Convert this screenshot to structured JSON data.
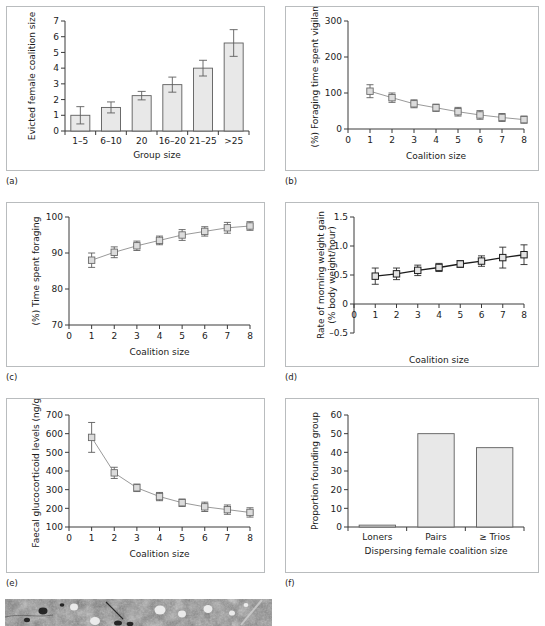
{
  "figure": {
    "panel_labels": [
      "(a)",
      "(b)",
      "(c)",
      "(d)",
      "(e)",
      "(f)",
      "(e)"
    ]
  },
  "chart_data": [
    {
      "id": "a",
      "panel_label": "(a)",
      "type": "bar",
      "title": "",
      "xlabel": "Group size",
      "ylabel": "Evicted female coalition size",
      "categories": [
        "1–5",
        "6–10",
        "20",
        "16–20",
        "21–25",
        ">25"
      ],
      "values": [
        1.0,
        1.5,
        2.25,
        2.95,
        4.0,
        5.6
      ],
      "errors": [
        0.55,
        0.35,
        0.27,
        0.48,
        0.5,
        0.85
      ],
      "ylim": [
        0,
        7
      ],
      "yticks": [
        0,
        1,
        2,
        3,
        4,
        5,
        6,
        7
      ],
      "grid": false,
      "legend": "none"
    },
    {
      "id": "b",
      "panel_label": "(b)",
      "type": "line",
      "title": "",
      "xlabel": "Coalition size",
      "ylabel": "(%) Foraging time spent vigilant",
      "x": [
        1,
        2,
        3,
        4,
        5,
        6,
        7,
        8
      ],
      "values": [
        105,
        87,
        70,
        59,
        48,
        39,
        32,
        26
      ],
      "errors": [
        18,
        13,
        11,
        10,
        12,
        12,
        11,
        10
      ],
      "xlim": [
        0,
        8
      ],
      "xticks": [
        0,
        1,
        2,
        3,
        4,
        5,
        6,
        7,
        8
      ],
      "ylim": [
        0,
        300
      ],
      "yticks": [
        0,
        100,
        200,
        300
      ],
      "grid": false,
      "legend": "none"
    },
    {
      "id": "c",
      "panel_label": "(c)",
      "type": "line",
      "title": "",
      "xlabel": "Coalition size",
      "ylabel": "(%) Time spent foraging",
      "x": [
        1,
        2,
        3,
        4,
        5,
        6,
        7,
        8
      ],
      "values": [
        88.0,
        90.2,
        92.0,
        93.5,
        95.0,
        96.0,
        97.0,
        97.5
      ],
      "errors": [
        2.0,
        1.5,
        1.3,
        1.2,
        1.5,
        1.3,
        1.5,
        1.2
      ],
      "xlim": [
        0,
        8
      ],
      "xticks": [
        0,
        1,
        2,
        3,
        4,
        5,
        6,
        7,
        8
      ],
      "ylim": [
        70,
        100
      ],
      "yticks": [
        70,
        80,
        90,
        100
      ],
      "grid": false,
      "legend": "none"
    },
    {
      "id": "d",
      "panel_label": "(d)",
      "type": "line",
      "title": "",
      "xlabel": "Coalition size",
      "ylabel": "Rate of morning weight gain (% body weight/hour)",
      "ylabel_line1": "Rate of morning weight gain",
      "ylabel_line2": "(% body weight/hour)",
      "x": [
        1,
        2,
        3,
        4,
        5,
        6,
        7,
        8
      ],
      "values": [
        0.48,
        0.52,
        0.58,
        0.63,
        0.69,
        0.74,
        0.8,
        0.85
      ],
      "errors": [
        0.14,
        0.1,
        0.09,
        0.07,
        0.06,
        0.09,
        0.18,
        0.17
      ],
      "xlim": [
        0,
        8
      ],
      "xticks": [
        0,
        1,
        2,
        3,
        4,
        5,
        6,
        7,
        8
      ],
      "ylim": [
        -0.5,
        1.5
      ],
      "yticks": [
        -0.5,
        0,
        0.5,
        1.0,
        1.5
      ],
      "ytick_labels": [
        "–0.5",
        "0",
        "0.5",
        "1.0",
        "1.5"
      ],
      "grid": false,
      "legend": "none"
    },
    {
      "id": "e",
      "panel_label": "(e)",
      "type": "line",
      "title": "",
      "xlabel": "Coalition size",
      "ylabel": "Faecal glucocorticoid levels (ng/g)",
      "x": [
        1,
        2,
        3,
        4,
        5,
        6,
        7,
        8
      ],
      "values": [
        580,
        390,
        310,
        263,
        230,
        208,
        193,
        178
      ],
      "errors": [
        80,
        30,
        20,
        22,
        20,
        25,
        25,
        25
      ],
      "xlim": [
        0,
        8
      ],
      "xticks": [
        0,
        1,
        2,
        3,
        4,
        5,
        6,
        7,
        8
      ],
      "ylim": [
        100,
        700
      ],
      "yticks": [
        100,
        200,
        300,
        400,
        500,
        600,
        700
      ],
      "grid": false,
      "legend": "none"
    },
    {
      "id": "f",
      "panel_label": "(f)",
      "type": "bar",
      "title": "",
      "xlabel": "Dispersing female coalition size",
      "ylabel": "Proportion founding group",
      "categories": [
        "Loners",
        "Pairs",
        "≥ Trios"
      ],
      "values": [
        1.0,
        50.0,
        42.5
      ],
      "ylim": [
        0,
        60
      ],
      "yticks": [
        0,
        10,
        20,
        30,
        40,
        50,
        60
      ],
      "grid": false,
      "legend": "none"
    }
  ],
  "photo": {
    "panel_label": "(e)",
    "alt": "grayscale field photograph strip"
  },
  "colors": {
    "frame": "#b9bcbe",
    "axis": "#3a3a3a",
    "bar_fill": "#e8e8e8",
    "bar_stroke": "#5d5d5d",
    "line_light": "#9a9a9a",
    "line_dark": "#1d1d1d",
    "text": "#1b1b1b"
  }
}
